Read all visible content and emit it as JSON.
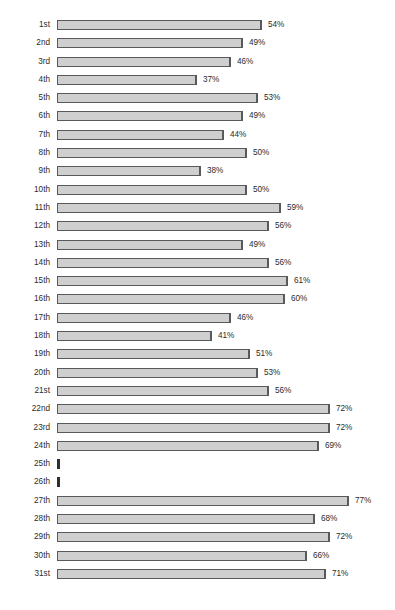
{
  "chart": {
    "title": "",
    "title_visible": false
  },
  "chart_data": {
    "type": "bar",
    "orientation": "horizontal",
    "title": "",
    "xlabel": "",
    "ylabel": "",
    "xlim": [
      0,
      77
    ],
    "grid": false,
    "legend": null,
    "value_suffix": "%",
    "categories": [
      "1st",
      "2nd",
      "3rd",
      "4th",
      "5th",
      "6th",
      "7th",
      "8th",
      "9th",
      "10th",
      "11th",
      "12th",
      "13th",
      "14th",
      "15th",
      "16th",
      "17th",
      "18th",
      "19th",
      "20th",
      "21st",
      "22nd",
      "23rd",
      "24th",
      "25th",
      "26th",
      "27th",
      "28th",
      "29th",
      "30th",
      "31st"
    ],
    "values": [
      54,
      49,
      46,
      37,
      53,
      49,
      44,
      50,
      38,
      50,
      59,
      56,
      49,
      56,
      61,
      60,
      46,
      41,
      51,
      53,
      56,
      72,
      72,
      69,
      0,
      0,
      77,
      68,
      72,
      66,
      71
    ],
    "labels": [
      "54%",
      "49%",
      "46%",
      "37%",
      "53%",
      "49%",
      "44%",
      "50%",
      "38%",
      "50%",
      "59%",
      "56%",
      "49%",
      "56%",
      "61%",
      "60%",
      "46%",
      "41%",
      "51%",
      "53%",
      "56%",
      "72%",
      "72%",
      "69%",
      "",
      "",
      "77%",
      "68%",
      "72%",
      "66%",
      "71%"
    ],
    "bar_fill": "#cfcfcf",
    "bar_border": "#58595b",
    "nub_color": "#2f2f2f",
    "background": "#ffffff"
  }
}
